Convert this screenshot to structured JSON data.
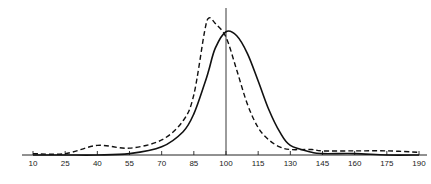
{
  "chart_data": {
    "type": "line",
    "title": "",
    "xlabel": "",
    "ylabel": "",
    "x_ticks": [
      10,
      25,
      40,
      55,
      70,
      85,
      100,
      115,
      130,
      145,
      160,
      175,
      190
    ],
    "xlim": [
      10,
      190
    ],
    "ylim": [
      0,
      100
    ],
    "grid": false,
    "legend": null,
    "reference_line": {
      "x": 100,
      "style": "solid vertical"
    },
    "x": [
      10,
      25,
      40,
      55,
      70,
      80,
      85,
      90,
      92,
      95,
      100,
      105,
      110,
      115,
      120,
      125,
      130,
      140,
      145,
      160,
      175,
      190
    ],
    "series": [
      {
        "name": "solid",
        "style": "solid",
        "values": [
          0,
          0,
          0,
          1,
          6,
          17,
          30,
          52,
          62,
          78,
          90,
          87,
          74,
          54,
          33,
          17,
          7,
          2,
          1,
          1,
          0,
          0
        ]
      },
      {
        "name": "dashed",
        "style": "dashed",
        "values": [
          1,
          1,
          7,
          5,
          11,
          25,
          44,
          90,
          100,
          96,
          86,
          62,
          37,
          20,
          11,
          6,
          4,
          4,
          3,
          3,
          3,
          2
        ]
      }
    ]
  }
}
